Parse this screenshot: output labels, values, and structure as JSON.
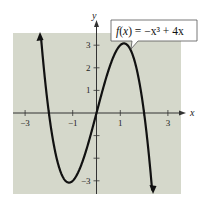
{
  "chart_data": {
    "type": "line",
    "title": "",
    "function": "f(x) = -x^3 + 4x",
    "annotation": {
      "label_prefix": "f(x) = ",
      "label_expr": "−x³ + 4x"
    },
    "xlabel": "x",
    "ylabel": "y",
    "xlim": [
      -3.5,
      3.5
    ],
    "ylim": [
      -3.5,
      3.5
    ],
    "x_ticks": [
      -3,
      -2,
      -1,
      1,
      2,
      3
    ],
    "x_tick_labels": [
      {
        "value": -3,
        "label": "−3"
      },
      {
        "value": -1,
        "label": "−1"
      },
      {
        "value": 1,
        "label": "1"
      },
      {
        "value": 3,
        "label": "3"
      }
    ],
    "y_ticks": [
      -3,
      -2,
      -1,
      1,
      2,
      3
    ],
    "y_tick_labels": [
      {
        "value": 3,
        "label": "3"
      },
      {
        "value": 2,
        "label": "2"
      },
      {
        "value": 1,
        "label": "1"
      },
      {
        "value": -3,
        "label": "−3"
      }
    ],
    "series": [
      {
        "name": "f(x) = -x^3 + 4x",
        "x": [
          -2.4,
          -2.2,
          -2,
          -1.8,
          -1.6,
          -1.4,
          -1.155,
          -1,
          -0.8,
          -0.6,
          -0.4,
          -0.2,
          0,
          0.2,
          0.4,
          0.6,
          0.8,
          1,
          1.155,
          1.4,
          1.6,
          1.8,
          2,
          2.2,
          2.4
        ],
        "y": [
          4.22,
          1.85,
          0,
          -1.37,
          -2.3,
          -2.86,
          -3.08,
          -3.0,
          -2.69,
          -2.18,
          -1.54,
          -0.79,
          0,
          0.79,
          1.54,
          2.18,
          2.69,
          3.0,
          3.08,
          2.86,
          2.3,
          1.37,
          0,
          -1.85,
          -4.22
        ]
      }
    ],
    "key_points": {
      "local_min": {
        "x": -1.155,
        "y": -3.08
      },
      "local_max": {
        "x": 1.155,
        "y": 3.08
      },
      "zeros": [
        -2,
        0,
        2
      ]
    },
    "grid": false,
    "legend": "none",
    "colors": {
      "panel_bg": "#d5d8cb",
      "curve": "#111111",
      "axis": "#333333"
    }
  }
}
